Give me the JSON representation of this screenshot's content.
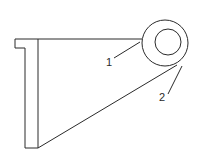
{
  "diagram": {
    "type": "mechanical-bracket",
    "colors": {
      "line": "#2a2a2a",
      "background": "#ffffff"
    },
    "labels": [
      {
        "id": "1",
        "text": "1"
      },
      {
        "id": "2",
        "text": "2"
      }
    ]
  }
}
